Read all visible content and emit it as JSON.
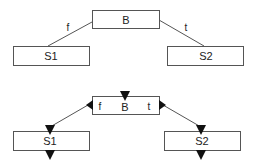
{
  "diagrams": [
    {
      "name": "simple-tree",
      "nodes": {
        "root": {
          "label": "B"
        },
        "left": {
          "label": "S1"
        },
        "right": {
          "label": "S2"
        }
      },
      "edges": {
        "left": {
          "label": "f"
        },
        "right": {
          "label": "t"
        }
      }
    },
    {
      "name": "tree-with-ports",
      "nodes": {
        "root": {
          "label": "B"
        },
        "left": {
          "label": "S1"
        },
        "right": {
          "label": "S2"
        }
      },
      "edges": {
        "left": {
          "label": "f"
        },
        "right": {
          "label": "t"
        }
      }
    }
  ],
  "colors": {
    "stroke": "#555555",
    "arrow": "#111111",
    "text": "#222222",
    "background": "#ffffff"
  }
}
